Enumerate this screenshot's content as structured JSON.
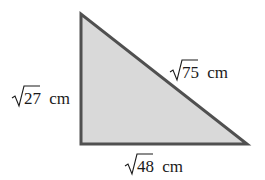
{
  "diagram": {
    "type": "right-triangle",
    "colors": {
      "fill": "#d9d9d9",
      "stroke": "#505050",
      "text": "#1a1a1a"
    },
    "vertices": {
      "top": [
        81,
        14
      ],
      "right_angle": [
        81,
        144
      ],
      "bottom_right": [
        247,
        144
      ]
    },
    "sides": {
      "vertical": {
        "radicand": "27",
        "unit": "cm"
      },
      "hypotenuse": {
        "radicand": "75",
        "unit": "cm"
      },
      "horizontal": {
        "radicand": "48",
        "unit": "cm"
      }
    }
  }
}
